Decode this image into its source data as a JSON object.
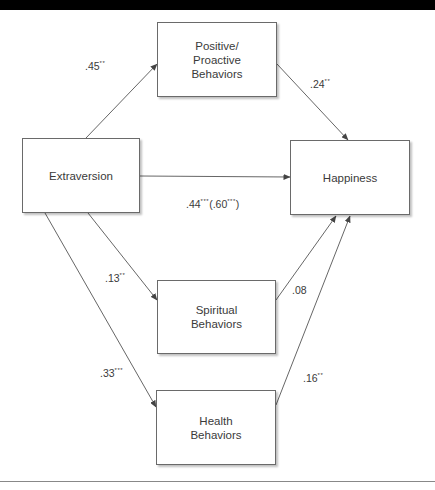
{
  "diagram": {
    "type": "path-model",
    "nodes": [
      {
        "id": "extraversion",
        "label": "Extraversion",
        "x": 22,
        "y": 138,
        "w": 118,
        "h": 75
      },
      {
        "id": "positive",
        "label": "Positive/\nProactive\nBehaviors",
        "x": 157,
        "y": 22,
        "w": 120,
        "h": 75
      },
      {
        "id": "happiness",
        "label": "Happiness",
        "x": 290,
        "y": 140,
        "w": 120,
        "h": 75
      },
      {
        "id": "spiritual",
        "label": "Spiritual\nBehaviors",
        "x": 157,
        "y": 280,
        "w": 119,
        "h": 74
      },
      {
        "id": "health",
        "label": "Health\nBehaviors",
        "x": 156,
        "y": 390,
        "w": 120,
        "h": 75
      }
    ],
    "edges": [
      {
        "from": "extraversion",
        "to": "positive",
        "coef": ".45",
        "sig": "**",
        "extra": "",
        "extra_sig": ""
      },
      {
        "from": "positive",
        "to": "happiness",
        "coef": ".24",
        "sig": "**",
        "extra": "",
        "extra_sig": ""
      },
      {
        "from": "extraversion",
        "to": "happiness",
        "coef": ".44",
        "sig": "***",
        "extra": ".60",
        "extra_sig": "***"
      },
      {
        "from": "extraversion",
        "to": "spiritual",
        "coef": ".13",
        "sig": "**",
        "extra": "",
        "extra_sig": ""
      },
      {
        "from": "spiritual",
        "to": "happiness",
        "coef": ".08",
        "sig": "",
        "extra": "",
        "extra_sig": ""
      },
      {
        "from": "extraversion",
        "to": "health",
        "coef": ".33",
        "sig": "***",
        "extra": "",
        "extra_sig": ""
      },
      {
        "from": "health",
        "to": "happiness",
        "coef": ".16",
        "sig": "**",
        "extra": "",
        "extra_sig": ""
      }
    ]
  },
  "colors": {
    "line": "#555555",
    "box_border": "#6a6a6a",
    "header_bar": "#000000",
    "text": "#3a3a3a"
  }
}
